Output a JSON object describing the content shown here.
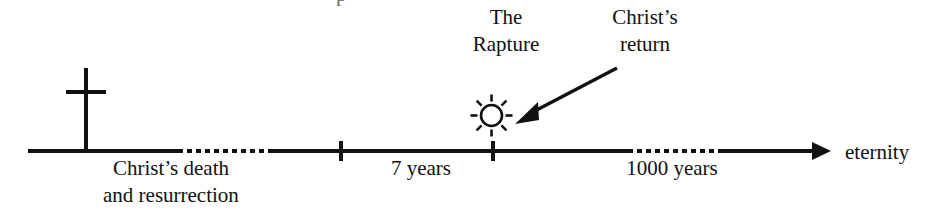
{
  "diagram": {
    "background_color": "#ffffff",
    "ink_color": "#111111",
    "width": 932,
    "height": 212
  },
  "timeline": {
    "axis_label_right": "eternity",
    "segments": [
      {
        "name": "pre-dotted-solid",
        "style": "solid",
        "x_start": 28,
        "x_end": 178
      },
      {
        "name": "gap-era",
        "style": "dotted",
        "x_start": 178,
        "x_end": 272
      },
      {
        "name": "pre-tribulation",
        "style": "solid",
        "x_start": 272,
        "x_end": 628
      },
      {
        "name": "millennium-gap",
        "style": "dotted",
        "x_start": 628,
        "x_end": 720
      },
      {
        "name": "eternity-run",
        "style": "solid",
        "x_start": 720,
        "x_end": 816
      }
    ],
    "ticks": [
      {
        "name": "tribulation-start",
        "x": 341
      },
      {
        "name": "christs-return",
        "x": 492
      }
    ],
    "period_labels": [
      {
        "name": "seven-years",
        "text": "7 years",
        "x": 421
      },
      {
        "name": "thousand-years",
        "text": "1000 years",
        "x": 672
      }
    ]
  },
  "markers": {
    "cross": {
      "icon": "cross-icon",
      "label_line1": "Christ’s death",
      "label_line2": "and resurrection"
    },
    "rapture": {
      "icon": "sun-icon",
      "label_line1": "The",
      "label_line2": "Rapture"
    },
    "return": {
      "icon": "arrow-pointer-icon",
      "label_line1": "Christ’s",
      "label_line2": "return"
    }
  },
  "artifacts": {
    "top_clipped_fragment": "p"
  }
}
